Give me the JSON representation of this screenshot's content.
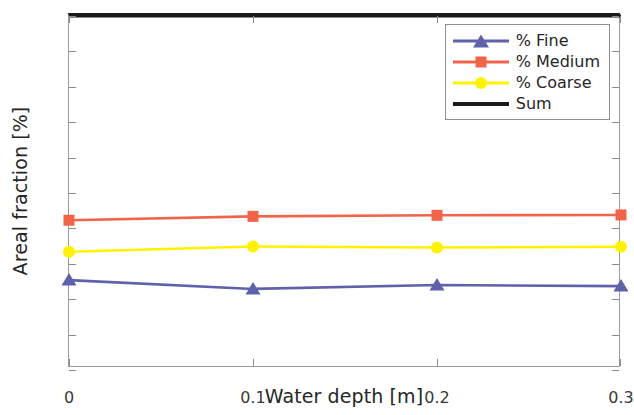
{
  "chart_data": {
    "type": "line",
    "title": "",
    "xlabel": "Water depth [m]",
    "ylabel": "Areal fraction [%]",
    "x": [
      0,
      0.1,
      0.2,
      0.3
    ],
    "xtick_labels": [
      "0",
      "0.1",
      "0.2",
      "0.3"
    ],
    "ytick_labels": [
      "0",
      "10",
      "20",
      "30",
      "40",
      "50",
      "60",
      "70",
      "80",
      "90",
      "100"
    ],
    "xlim": [
      0,
      0.3
    ],
    "ylim": [
      0,
      100
    ],
    "grid": false,
    "legend_position": "top-right",
    "series": [
      {
        "name": "% Fine",
        "color": "#5f61ab",
        "marker": "triangle",
        "values": [
          25.4,
          22.9,
          24.0,
          23.7
        ]
      },
      {
        "name": "% Medium",
        "color": "#f2644a",
        "marker": "square",
        "values": [
          42.3,
          43.4,
          43.7,
          43.8
        ]
      },
      {
        "name": "% Coarse",
        "color": "#fff200",
        "marker": "circle",
        "values": [
          33.4,
          34.9,
          34.6,
          34.8
        ]
      },
      {
        "name": "Sum",
        "color": "#1a1a1a",
        "marker": "none",
        "values": [
          100,
          100,
          100,
          100
        ]
      }
    ]
  },
  "axes": {
    "x_title": "Water depth [m]",
    "y_title": "Areal fraction [%]",
    "x_ticks": [
      "0",
      "0.1",
      "0.2",
      "0.3"
    ],
    "y_ticks": [
      "0",
      "10",
      "20",
      "30",
      "40",
      "50",
      "60",
      "70",
      "80",
      "90",
      "100"
    ]
  },
  "legend": {
    "entries": [
      {
        "label": "% Fine",
        "color": "#5f61ab",
        "marker": "triangle"
      },
      {
        "label": "% Medium",
        "color": "#f2644a",
        "marker": "square"
      },
      {
        "label": "% Coarse",
        "color": "#fff200",
        "marker": "circle"
      },
      {
        "label": "Sum",
        "color": "#1a1a1a",
        "marker": "none"
      }
    ]
  }
}
